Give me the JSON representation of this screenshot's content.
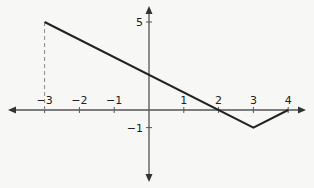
{
  "chart_data": {
    "type": "line",
    "title": "",
    "xlabel": "",
    "ylabel": "",
    "xlim": [
      -4,
      4.5
    ],
    "ylim": [
      -2.5,
      5.5
    ],
    "grid": false,
    "series": [
      {
        "name": "f",
        "x": [
          -3,
          3,
          4
        ],
        "y": [
          5,
          -1,
          0
        ]
      }
    ],
    "x_ticks": [
      -3,
      -2,
      -1,
      1,
      2,
      3,
      4
    ],
    "y_ticks": [
      5,
      -1
    ],
    "x_tick_labels": [
      "−3",
      "−2",
      "−1",
      "1",
      "2",
      "3",
      "4"
    ],
    "y_tick_labels": [
      "5",
      "−1"
    ],
    "annotations": [
      {
        "type": "dashed-vertical",
        "x": -3,
        "from_y": 0,
        "to_y": 5
      }
    ]
  },
  "colors": {
    "line": "#222222",
    "axis": "#555555",
    "dashed": "#888888"
  }
}
